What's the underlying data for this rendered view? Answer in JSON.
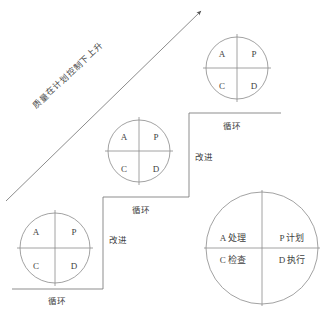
{
  "diagram": {
    "arrow_caption": "质量在计划控制下上升",
    "line_color": "#7a7a7a",
    "text_color": "#3f3f3f",
    "background": "#ffffff"
  },
  "cycles": [
    {
      "id": "cycle-bottom",
      "quadrants": {
        "top_left": "A",
        "top_right": "P",
        "bottom_left": "C",
        "bottom_right": "D"
      }
    },
    {
      "id": "cycle-middle",
      "quadrants": {
        "top_left": "A",
        "top_right": "P",
        "bottom_left": "C",
        "bottom_right": "D"
      }
    },
    {
      "id": "cycle-top",
      "quadrants": {
        "top_left": "A",
        "top_right": "P",
        "bottom_left": "C",
        "bottom_right": "D"
      }
    }
  ],
  "steps": {
    "tread_label_1": "循环",
    "tread_label_2": "循环",
    "tread_label_3": "循环",
    "riser_label_1": "改进",
    "riser_label_2": "改进"
  },
  "legend": {
    "id": "legend-circle",
    "top_left": "A 处理",
    "top_right": "P 计划",
    "bottom_left": "C 检查",
    "bottom_right": "D 执行"
  }
}
